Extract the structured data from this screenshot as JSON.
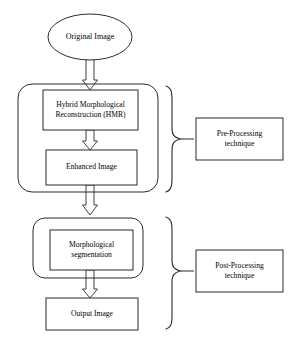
{
  "diagram": {
    "stroke_color": "#2b2b2b",
    "fill_color": "#ffffff",
    "nodes": {
      "original_image": {
        "label": "Original Image",
        "shape": "ellipse"
      },
      "hmr": {
        "label": "Hybrid  Morphological\nReconstruction  (HMR)",
        "shape": "rectangle"
      },
      "enhanced_image": {
        "label": "Enhanced Image",
        "shape": "rectangle"
      },
      "morphological_segmentation": {
        "label": "Morphological\nsegmentation",
        "shape": "rectangle"
      },
      "output_image": {
        "label": "Output Image",
        "shape": "rectangle"
      },
      "pre_processing": {
        "label": "Pre-Processing\ntechnique",
        "shape": "rectangle"
      },
      "post_processing": {
        "label": "Post-Processing\ntechnique",
        "shape": "rectangle"
      }
    },
    "groups": {
      "pre_processing_group": {
        "shape": "rounded-rectangle",
        "contains": [
          "hmr",
          "enhanced_image"
        ]
      },
      "post_processing_group": {
        "shape": "rounded-rectangle",
        "contains": [
          "morphological_segmentation"
        ]
      }
    },
    "braces": {
      "pre_brace": {
        "orientation": "right-pointing"
      },
      "post_brace": {
        "orientation": "right-pointing"
      }
    },
    "connectors": [
      {
        "from": "original_image",
        "to": "hmr",
        "style": "block-arrow-down"
      },
      {
        "from": "hmr",
        "to": "enhanced_image",
        "style": "block-arrow-down"
      },
      {
        "from": "enhanced_image",
        "to": "morphological_segmentation",
        "style": "block-arrow-down"
      },
      {
        "from": "morphological_segmentation",
        "to": "output_image",
        "style": "block-arrow-down"
      }
    ]
  }
}
